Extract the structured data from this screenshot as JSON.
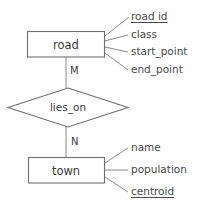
{
  "diagram": {
    "notation": "chen-er",
    "stroke_color": "#6e6e6e",
    "connector_color": "#8a8a8a",
    "text_color": "#3a3a3a",
    "background_color": "#ffffff"
  },
  "entities": [
    {
      "id": "road",
      "label": "road",
      "attributes": [
        {
          "label": "road id",
          "primary_key": true
        },
        {
          "label": "class",
          "primary_key": false
        },
        {
          "label": "start_point",
          "primary_key": false
        },
        {
          "label": "end_point",
          "primary_key": false
        }
      ]
    },
    {
      "id": "town",
      "label": "town",
      "attributes": [
        {
          "label": "name",
          "primary_key": false
        },
        {
          "label": "population",
          "primary_key": false
        },
        {
          "label": "centroid",
          "primary_key": true
        }
      ]
    }
  ],
  "relationship": {
    "id": "lies_on",
    "label": "lies_on",
    "from_entity": "road",
    "to_entity": "town",
    "cardinality_from": "M",
    "cardinality_to": "N"
  }
}
